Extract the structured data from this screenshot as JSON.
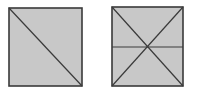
{
  "diagram": {
    "colors": {
      "fill": "#c8c8c8",
      "stroke": "#3a3a3a",
      "background": "#ffffff"
    },
    "shapes": [
      {
        "name": "square-one-diagonal",
        "x": 9,
        "y": 8,
        "w": 73,
        "h": 78,
        "lines": [
          {
            "type": "diagonal",
            "from": "top-left",
            "to": "bottom-right"
          }
        ]
      },
      {
        "name": "square-two-diagonals-midline",
        "x": 112,
        "y": 7,
        "w": 71,
        "h": 79,
        "lines": [
          {
            "type": "diagonal",
            "from": "top-left",
            "to": "bottom-right"
          },
          {
            "type": "diagonal",
            "from": "top-right",
            "to": "bottom-left"
          },
          {
            "type": "horizontal",
            "at": "middle"
          }
        ]
      }
    ]
  }
}
